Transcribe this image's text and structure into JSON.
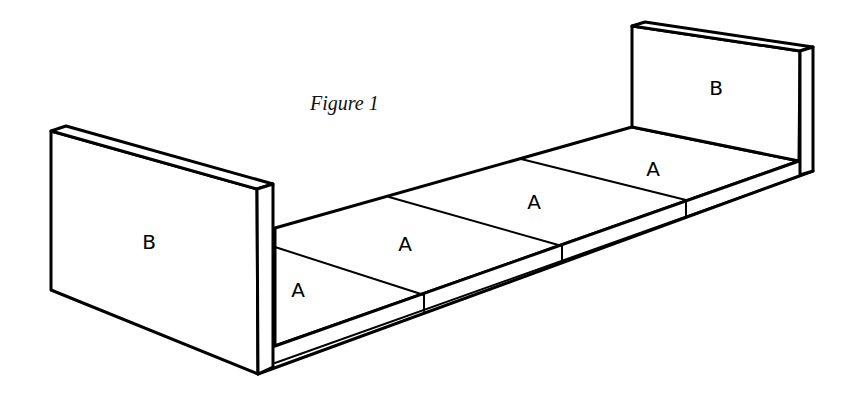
{
  "figure": {
    "caption": "Figure 1",
    "panels": [
      {
        "id": "left-end",
        "label": "B"
      },
      {
        "id": "right-end",
        "label": "B"
      }
    ],
    "slabs": [
      {
        "index": 1,
        "label": "A"
      },
      {
        "index": 2,
        "label": "A"
      },
      {
        "index": 3,
        "label": "A"
      },
      {
        "index": 4,
        "label": "A"
      }
    ],
    "colors": {
      "line": "#000000",
      "background": "#ffffff"
    }
  }
}
